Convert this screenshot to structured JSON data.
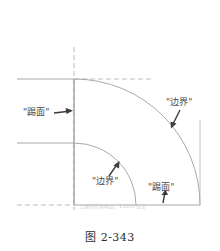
{
  "figure": {
    "caption": "图 2-343",
    "watermark_text": "广土建的传具构造，13500  形金"
  },
  "labels": {
    "riser_left": "\"踢面\"",
    "edge_right": "\"边界\"",
    "edge_lower": "\"边界\"",
    "riser_lower": "\"踢面\""
  },
  "colors": {
    "line": "#a9a9a9",
    "arrow": "#3c3c3c",
    "text": "#4a4a4a",
    "caption": "#2b2b2b",
    "watermark": "#c9c9c9",
    "background": "#ffffff"
  },
  "geometry": {
    "arc_center_x": 74,
    "arc_center_y": 205,
    "outer_radius": 126,
    "inner_radius": 62,
    "top_line_y": 79,
    "middle_line_y": 143,
    "bottom_line_y": 205,
    "center_line_x": 74,
    "right_edge_x": 200,
    "left_edge_x": 17
  }
}
